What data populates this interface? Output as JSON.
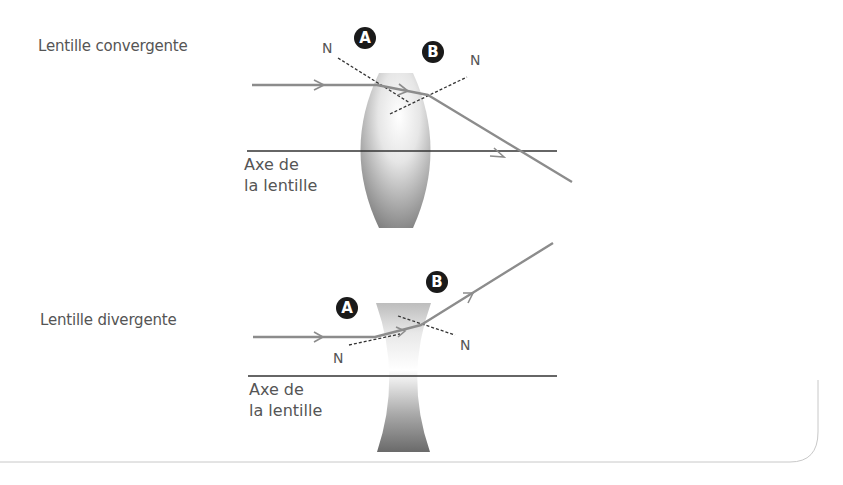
{
  "diagram": {
    "converging": {
      "title": "Lentille convergente",
      "axis_label": "Axe de\nla lentille",
      "point_a": "A",
      "point_b": "B",
      "normal_a": "N",
      "normal_b": "N"
    },
    "diverging": {
      "title": "Lentille divergente",
      "axis_label": "Axe de\nla lentille",
      "point_a": "A",
      "point_b": "B",
      "normal_a": "N",
      "normal_b": "N"
    },
    "colors": {
      "ray": "#8c8c8c",
      "axis": "#333333",
      "normal": "#333333",
      "badge": "#1a1a1a",
      "lens_dark": "#7a7a7a",
      "lens_light": "#ffffff",
      "frame": "#c8c8c8"
    }
  }
}
